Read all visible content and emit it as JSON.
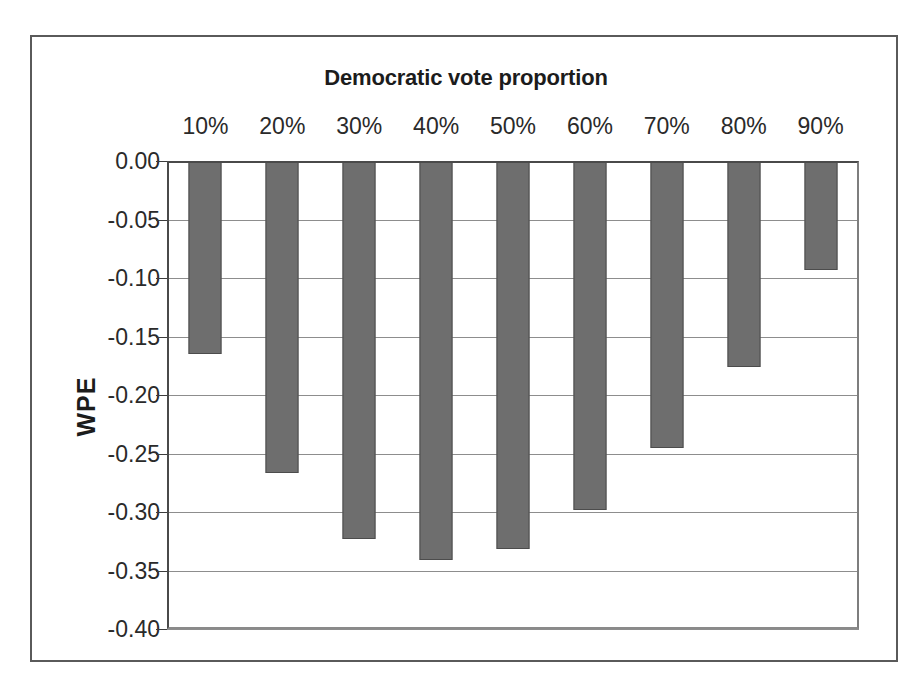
{
  "chart_data": {
    "type": "bar",
    "title": "Democratic vote proportion",
    "xlabel": "",
    "ylabel": "WPE",
    "categories": [
      "10%",
      "20%",
      "30%",
      "40%",
      "50%",
      "60%",
      "70%",
      "80%",
      "90%"
    ],
    "values": [
      -0.165,
      -0.267,
      -0.323,
      -0.341,
      -0.332,
      -0.298,
      -0.245,
      -0.176,
      -0.093
    ],
    "series": [
      {
        "name": "WPE",
        "values": [
          -0.165,
          -0.267,
          -0.323,
          -0.341,
          -0.332,
          -0.298,
          -0.245,
          -0.176,
          -0.093
        ]
      }
    ],
    "ylim": [
      -0.4,
      0.0
    ],
    "ytick_labels": [
      "0.00",
      "-0.05",
      "-0.10",
      "-0.15",
      "-0.20",
      "-0.25",
      "-0.30",
      "-0.35",
      "-0.40"
    ],
    "ytick_values": [
      0.0,
      -0.05,
      -0.1,
      -0.15,
      -0.2,
      -0.25,
      -0.3,
      -0.35,
      -0.4
    ],
    "grid": true,
    "legend": false,
    "legend_position": "none",
    "bar_color": "#6e6e6e",
    "bar_edge_color": "#4c4c4c",
    "gridline_color": "#8d8d8d",
    "axis_color": "#4a4a4a",
    "background_color": "#ffffff",
    "text_color": "#1c1c1c",
    "x_axis_position": "top"
  }
}
